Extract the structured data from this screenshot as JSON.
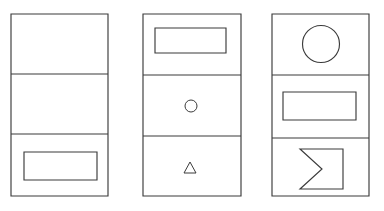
{
  "figure": {
    "title": "Three-panel geometric shape matrix",
    "background_color": "#ffffff",
    "stroke_color": "#3b3b3b",
    "panel_count": 3,
    "cells_per_panel": 3,
    "panels": [
      {
        "id": "panel-1",
        "label": "Panel 1",
        "x": 11,
        "y": 14,
        "width": 97,
        "height": 182,
        "dividers_y": [
          74,
          134
        ],
        "cells": [
          {
            "id": "panel-1-cell-1",
            "label": "Panel 1 top cell",
            "shape": "empty",
            "shape_label": "empty"
          },
          {
            "id": "panel-1-cell-2",
            "label": "Panel 1 middle cell",
            "shape": "empty",
            "shape_label": "empty"
          },
          {
            "id": "panel-1-cell-3",
            "label": "Panel 1 bottom cell",
            "shape": "rectangle",
            "shape_label": "rectangle",
            "x": 24,
            "y": 152,
            "width": 73,
            "height": 28
          }
        ]
      },
      {
        "id": "panel-2",
        "label": "Panel 2",
        "x": 143,
        "y": 14,
        "width": 98,
        "height": 182,
        "dividers_y": [
          75,
          136
        ],
        "cells": [
          {
            "id": "panel-2-cell-1",
            "label": "Panel 2 top cell",
            "shape": "rectangle",
            "shape_label": "rectangle",
            "x": 155,
            "y": 28,
            "width": 71,
            "height": 25
          },
          {
            "id": "panel-2-cell-2",
            "label": "Panel 2 middle cell",
            "shape": "circle",
            "shape_label": "small circle",
            "cx": 191,
            "cy": 106,
            "r": 6
          },
          {
            "id": "panel-2-cell-3",
            "label": "Panel 2 bottom cell",
            "shape": "triangle",
            "shape_label": "small triangle",
            "cx": 190,
            "cy": 168,
            "size": 11
          }
        ]
      },
      {
        "id": "panel-3",
        "label": "Panel 3",
        "x": 272,
        "y": 14,
        "width": 97,
        "height": 182,
        "dividers_y": [
          75,
          138
        ],
        "cells": [
          {
            "id": "panel-3-cell-1",
            "label": "Panel 3 top cell",
            "shape": "circle",
            "shape_label": "large circle",
            "cx": 321,
            "cy": 44,
            "r": 18.5
          },
          {
            "id": "panel-3-cell-2",
            "label": "Panel 3 middle cell",
            "shape": "rectangle",
            "shape_label": "rectangle",
            "x": 283,
            "y": 92,
            "width": 73,
            "height": 28
          },
          {
            "id": "panel-3-cell-3",
            "label": "Panel 3 bottom cell",
            "shape": "chevron-notched-rectangle",
            "shape_label": "rectangle with V notch on left side",
            "points": "300,149 343,149 343,189 300,189 322,169"
          }
        ]
      }
    ]
  }
}
